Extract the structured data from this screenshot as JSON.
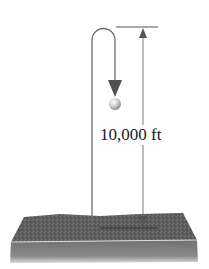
{
  "diagram": {
    "height_label": "10,000 ft",
    "elements": {
      "path_arrow": "U-shaped path rising from ground and descending to the falling object",
      "falling_object": "sphere",
      "dimension_line": "vertical double-headed arrow with top and bottom reference lines",
      "ground": "textured slab"
    },
    "colors": {
      "line": "#6b6b6b",
      "arrowhead": "#555555",
      "ground_top": "#5c5c5c",
      "ground_front": "#6e6e6e",
      "ground_highlight": "#d9d9d9",
      "ball_light": "#f2f2f2",
      "ball_dark": "#8a8a8a"
    }
  }
}
